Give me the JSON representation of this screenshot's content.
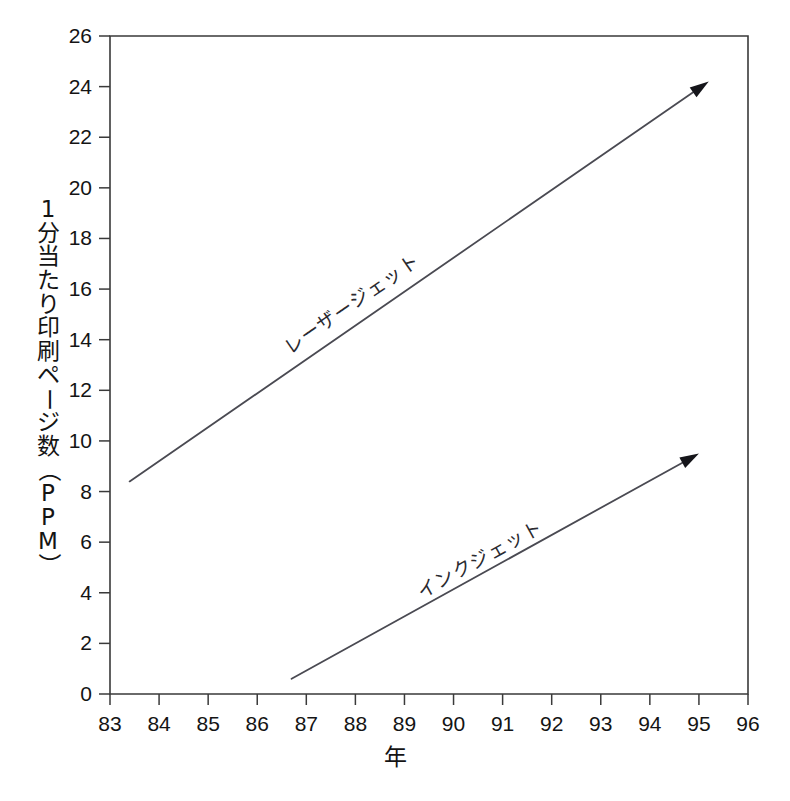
{
  "chart_data": {
    "type": "line",
    "title": "",
    "subtitle": "",
    "xlabel": "年",
    "ylabel": "1分当たり印刷ページ数（PPM）",
    "ylabel_chars": [
      "1",
      "分",
      "当",
      "た",
      "り",
      "印",
      "刷",
      "ペ",
      "ー",
      "ジ",
      "数",
      "（",
      "P",
      "P",
      "M",
      "）"
    ],
    "xlim": [
      83,
      96
    ],
    "ylim": [
      0,
      26
    ],
    "xticks": [
      83,
      84,
      85,
      86,
      87,
      88,
      89,
      90,
      91,
      92,
      93,
      94,
      95,
      96
    ],
    "yticks": [
      0,
      2,
      4,
      6,
      8,
      10,
      12,
      14,
      16,
      18,
      20,
      22,
      24,
      26
    ],
    "xtick_labels": [
      "83",
      "84",
      "85",
      "86",
      "87",
      "88",
      "89",
      "90",
      "91",
      "92",
      "93",
      "94",
      "95",
      "96"
    ],
    "ytick_labels": [
      "0",
      "2",
      "4",
      "6",
      "8",
      "10",
      "12",
      "14",
      "16",
      "18",
      "20",
      "22",
      "24",
      "26"
    ],
    "grid": false,
    "legend": "inline-annotations",
    "series": [
      {
        "name": "レーザージェット",
        "label_romaji": "Laser Jet",
        "x": [
          83.4,
          95.2
        ],
        "values": [
          8.4,
          24.2
        ],
        "arrow_end": true,
        "label_x": 88.0,
        "label_y": 15.2,
        "color": "#4a4a52"
      },
      {
        "name": "インクジェット",
        "label_romaji": "Ink Jet",
        "x": [
          86.7,
          95.0
        ],
        "values": [
          0.6,
          9.5
        ],
        "arrow_end": true,
        "label_x": 90.6,
        "label_y": 5.1,
        "color": "#4a4a52"
      }
    ],
    "annotations": [
      {
        "text": "レーザージェット",
        "x": 88.0,
        "y": 15.2
      },
      {
        "text": "インクジェット",
        "x": 90.6,
        "y": 5.1
      }
    ]
  },
  "colors": {
    "background": "#ffffff",
    "axis": "#3a3a3a",
    "line": "#4a4a52",
    "text": "#141414"
  }
}
